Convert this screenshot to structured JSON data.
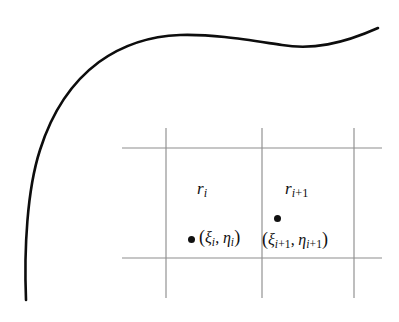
{
  "figure": {
    "background_color": "#ffffff",
    "width": 399,
    "height": 322
  },
  "boundary_curve": {
    "name": "domain-boundary-curve",
    "color": "#0d0d0d",
    "stroke_width": 2.6,
    "description": "smooth curve entering at bottom left, rounding a corner and extending to the right edge",
    "path": "M 26 300 C 24 250 27 190 40 150 C 52 112 72 82 99 62 C 124 44 152 36 180 35 C 214 34 248 40 282 45 C 312 50 342 44 378 28"
  },
  "grid": {
    "name": "rectangular-grid",
    "color": "#8e8e8e",
    "stroke_width": 1.15,
    "vertical_lines": [
      {
        "x": 166,
        "y1": 128,
        "y2": 298
      },
      {
        "x": 262,
        "y1": 128,
        "y2": 298
      },
      {
        "x": 354,
        "y1": 128,
        "y2": 298
      }
    ],
    "horizontal_lines": [
      {
        "y": 148,
        "x1": 122,
        "x2": 382
      },
      {
        "y": 258,
        "x1": 122,
        "x2": 382
      }
    ]
  },
  "cells": [
    {
      "id": "cell-i",
      "label_plain": "r_i",
      "label_symbol": "r",
      "label_sub": "i",
      "label_x": 197,
      "label_y": 180,
      "sample_point": {
        "name": "sample-point-i",
        "dot_x": 188,
        "dot_y": 236,
        "text_plain": "(xi_i, eta_i)",
        "open_paren": "(",
        "xi": "ξ",
        "xi_sub": "i",
        "comma": ",",
        "eta": "η",
        "eta_sub": "i",
        "close_paren": ")",
        "text_x": 196,
        "text_y": 228
      }
    },
    {
      "id": "cell-i-plus-1",
      "label_plain": "r_{i+1}",
      "label_symbol": "r",
      "label_sub_index": "i",
      "label_sub_plus": "+",
      "label_sub_one": "1",
      "label_x": 285,
      "label_y": 180,
      "sample_point": {
        "name": "sample-point-i-plus-1",
        "dot_x": 274,
        "dot_y": 215,
        "text_plain": "(xi_{i+1}, eta_{i+1})",
        "open_paren": "(",
        "xi": "ξ",
        "xi_sub_index": "i",
        "xi_sub_plus": "+",
        "xi_sub_one": "1",
        "comma": ",",
        "eta": "η",
        "eta_sub_index": "i",
        "eta_sub_plus": "+",
        "eta_sub_one": "1",
        "close_paren": ")",
        "text_x": 262,
        "text_y": 230
      }
    }
  ]
}
